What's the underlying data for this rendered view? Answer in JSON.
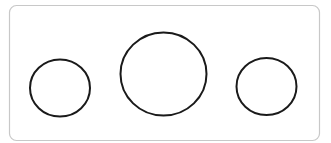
{
  "diagram": {
    "frame": {
      "x": 9.5,
      "y": 5.5,
      "width": 310,
      "height": 135,
      "radius": 7,
      "stroke": "#c8c8c8",
      "fill": "#ffffff",
      "stroke_width": 1.2
    },
    "shapes": [
      {
        "type": "circle",
        "label": "left-circle",
        "cx": 60,
        "cy": 88,
        "rx": 30,
        "ry": 28.5,
        "stroke": "#1a1a1a",
        "stroke_width": 2
      },
      {
        "type": "circle",
        "label": "center-circle",
        "cx": 163.5,
        "cy": 74,
        "rx": 43,
        "ry": 41.5,
        "stroke": "#1a1a1a",
        "stroke_width": 2
      },
      {
        "type": "circle",
        "label": "right-circle",
        "cx": 266.5,
        "cy": 86.5,
        "rx": 30,
        "ry": 28.5,
        "stroke": "#1a1a1a",
        "stroke_width": 2
      }
    ]
  }
}
